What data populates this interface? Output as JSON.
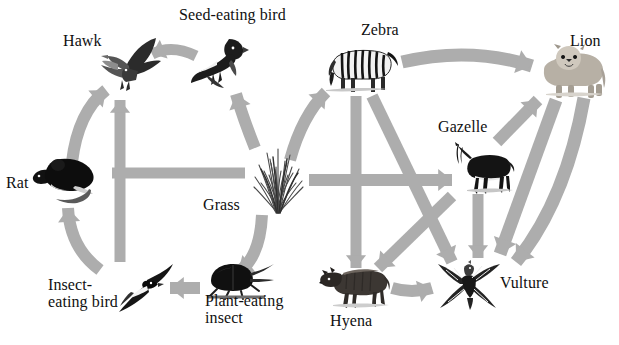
{
  "diagram": {
    "background_color": "#ffffff",
    "arrow_color": "#adadad",
    "text_color": "#101010"
  },
  "organisms": [
    {
      "id": "hawk",
      "label": "Hawk",
      "label_x": 63,
      "label_y": 33,
      "align": "left",
      "x": 96,
      "y": 36,
      "w": 66,
      "h": 56,
      "icon": "hawk-icon"
    },
    {
      "id": "seed_bird",
      "label": "Seed-eating bird",
      "label_x": 179,
      "label_y": 7,
      "align": "left",
      "x": 187,
      "y": 35,
      "w": 62,
      "h": 58,
      "icon": "seed-eating-bird-icon"
    },
    {
      "id": "rat",
      "label": "Rat",
      "label_x": 6,
      "label_y": 175,
      "align": "left",
      "x": 31,
      "y": 150,
      "w": 70,
      "h": 56,
      "icon": "rat-icon"
    },
    {
      "id": "grass",
      "label": "Grass",
      "label_x": 203,
      "label_y": 197,
      "align": "left",
      "x": 247,
      "y": 145,
      "w": 62,
      "h": 70,
      "icon": "grass-icon"
    },
    {
      "id": "insect_bird",
      "label": "Insect-\neating bird",
      "label_x": 48,
      "label_y": 277,
      "align": "left",
      "x": 111,
      "y": 262,
      "w": 64,
      "h": 52,
      "icon": "insect-eating-bird-icon"
    },
    {
      "id": "plant_insect",
      "label": "Plant-eating\ninsect",
      "label_x": 205,
      "label_y": 293,
      "align": "left",
      "x": 203,
      "y": 259,
      "w": 72,
      "h": 44,
      "icon": "plant-eating-insect-icon"
    },
    {
      "id": "zebra",
      "label": "Zebra",
      "label_x": 361,
      "label_y": 22,
      "align": "left",
      "x": 326,
      "y": 42,
      "w": 74,
      "h": 52,
      "icon": "zebra-icon"
    },
    {
      "id": "lion",
      "label": "Lion",
      "label_x": 570,
      "label_y": 33,
      "align": "left",
      "x": 534,
      "y": 42,
      "w": 72,
      "h": 56,
      "icon": "lion-icon"
    },
    {
      "id": "gazelle",
      "label": "Gazelle",
      "label_x": 438,
      "label_y": 119,
      "align": "left",
      "x": 455,
      "y": 142,
      "w": 60,
      "h": 52,
      "icon": "gazelle-icon"
    },
    {
      "id": "hyena",
      "label": "Hyena",
      "label_x": 330,
      "label_y": 313,
      "align": "left",
      "x": 319,
      "y": 263,
      "w": 72,
      "h": 46,
      "icon": "hyena-icon"
    },
    {
      "id": "vulture",
      "label": "Vulture",
      "label_x": 500,
      "label_y": 275,
      "align": "left",
      "x": 434,
      "y": 260,
      "w": 68,
      "h": 50,
      "icon": "vulture-icon"
    }
  ],
  "links": [
    {
      "id": "grass-to-rat",
      "from": "grass",
      "to": "rat",
      "shape": "straight"
    },
    {
      "id": "grass-to-seed-bird",
      "from": "grass",
      "to": "seed_bird",
      "shape": "curved"
    },
    {
      "id": "grass-to-plant-insect",
      "from": "grass",
      "to": "plant_insect",
      "shape": "curved"
    },
    {
      "id": "grass-to-zebra",
      "from": "grass",
      "to": "zebra",
      "shape": "curved"
    },
    {
      "id": "grass-to-gazelle",
      "from": "grass",
      "to": "gazelle",
      "shape": "straight"
    },
    {
      "id": "rat-to-hawk",
      "from": "rat",
      "to": "hawk",
      "shape": "curved"
    },
    {
      "id": "seed-bird-to-hawk",
      "from": "seed_bird",
      "to": "hawk",
      "shape": "curved"
    },
    {
      "id": "insect-bird-to-hawk",
      "from": "insect_bird",
      "to": "hawk",
      "shape": "straight"
    },
    {
      "id": "insect-bird-to-rat",
      "from": "insect_bird",
      "to": "rat",
      "shape": "curved"
    },
    {
      "id": "plant-insect-to-bird",
      "from": "plant_insect",
      "to": "insect_bird",
      "shape": "straight"
    },
    {
      "id": "zebra-to-lion",
      "from": "zebra",
      "to": "lion",
      "shape": "curved"
    },
    {
      "id": "zebra-to-hyena",
      "from": "zebra",
      "to": "hyena",
      "shape": "straight"
    },
    {
      "id": "zebra-to-vulture",
      "from": "zebra",
      "to": "vulture",
      "shape": "straight"
    },
    {
      "id": "gazelle-to-lion",
      "from": "gazelle",
      "to": "lion",
      "shape": "straight"
    },
    {
      "id": "gazelle-to-vulture",
      "from": "gazelle",
      "to": "vulture",
      "shape": "straight"
    },
    {
      "id": "gazelle-to-hyena",
      "from": "gazelle",
      "to": "hyena",
      "shape": "straight"
    },
    {
      "id": "lion-to-vulture",
      "from": "lion",
      "to": "vulture",
      "shape": "straight"
    },
    {
      "id": "lion-to-hyena",
      "from": "lion",
      "to": "hyena",
      "shape": "straight"
    },
    {
      "id": "hyena-to-vulture",
      "from": "hyena",
      "to": "vulture",
      "shape": "straight"
    }
  ],
  "arrow_geometry": {
    "shafts": [
      {
        "name": "arrow-grass-to-rat",
        "d": "M 245 173 L 112 173",
        "head": "left",
        "w": 11
      },
      {
        "name": "arrow-insectbird-to-hawk",
        "d": "M 120 262 L 120 100",
        "head": "up",
        "w": 11
      },
      {
        "name": "arrow-rat-to-hawk",
        "d": "M 72 162 Q 78 112 106 90",
        "head": "upright",
        "w": 12
      },
      {
        "name": "arrow-insectbird-to-rat",
        "d": "M 100 270 Q 70 248 68 208",
        "head": "up",
        "w": 12
      },
      {
        "name": "arrow-plantinsect-to-bird",
        "d": "M 200 288 L 170 288",
        "head": "left",
        "w": 12
      },
      {
        "name": "arrow-grass-to-plantinsect",
        "d": "M 262 215 Q 260 258 238 272",
        "head": "down",
        "w": 12
      },
      {
        "name": "arrow-grass-to-seedbird",
        "d": "M 255 148 Q 243 118 236 94",
        "head": "up",
        "w": 12
      },
      {
        "name": "arrow-seedbird-to-hawk",
        "d": "M 196 56 Q 172 44 152 54",
        "head": "left",
        "w": 11
      },
      {
        "name": "arrow-grass-to-zebra",
        "d": "M 290 160 Q 302 116 326 92",
        "head": "up",
        "w": 12
      },
      {
        "name": "arrow-grass-to-gazelle",
        "d": "M 309 180 L 452 180",
        "head": "right",
        "w": 12
      },
      {
        "name": "arrow-zebra-to-hyena",
        "d": "M 356 96 L 356 268",
        "head": "down",
        "w": 11
      },
      {
        "name": "arrow-zebra-to-vulture",
        "d": "M 372 96 L 452 262",
        "head": "down",
        "w": 12
      },
      {
        "name": "arrow-zebra-to-lion",
        "d": "M 402 62 Q 470 46 532 66",
        "head": "right",
        "w": 13
      },
      {
        "name": "arrow-gazelle-to-lion",
        "d": "M 497 142 L 538 100",
        "head": "up",
        "w": 12
      },
      {
        "name": "arrow-gazelle-to-vulture",
        "d": "M 478 194 L 478 258",
        "head": "down",
        "w": 11
      },
      {
        "name": "arrow-gazelle-to-hyena",
        "d": "M 452 196 L 378 268",
        "head": "down",
        "w": 12
      },
      {
        "name": "arrow-lion-to-vulture",
        "d": "M 556 100 L 500 254",
        "head": "down",
        "w": 13
      },
      {
        "name": "arrow-lion-to-hyena",
        "d": "M 584 98 Q 566 200 516 262",
        "head": "down",
        "w": 13
      },
      {
        "name": "arrow-hyena-to-vulture",
        "d": "M 392 288 Q 412 294 432 288",
        "head": "right",
        "w": 12
      }
    ]
  }
}
